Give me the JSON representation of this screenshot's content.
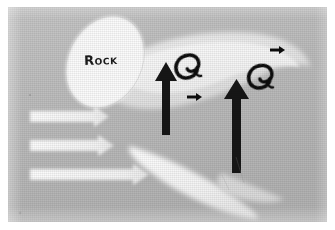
{
  "figure": {
    "kind": "photographed-diagram",
    "frame": {
      "width": 335,
      "height": 230,
      "plate_left": 8,
      "plate_top": 7,
      "plate_width": 319,
      "plate_height": 215,
      "background_color": "#b9b9b9",
      "paper_color": "#ffffff"
    }
  },
  "labels": {
    "rock": "Rock"
  },
  "colors": {
    "background_gray": "#b9b9b9",
    "wake_light": "#e9e9e9",
    "wake_pale": "#f4f4f4",
    "rock_white": "#fbfbfb",
    "arrow_white": "#fdfdfd",
    "arrow_black": "#121212",
    "eddy_black": "#101010",
    "label_text": "#1a1a1a"
  },
  "elements": {
    "rock": {
      "name": "rock",
      "shape": "tilted-ellipse",
      "cx": 105,
      "cy": 60,
      "rx": 40,
      "ry": 52,
      "rotation_deg": 28
    },
    "wake_upper": {
      "name": "upper-wake-lens",
      "shape": "lens",
      "note": "large pale lens-shaped separation zone downstream of the rock"
    },
    "wake_inner": {
      "name": "inner-wake-lens",
      "shape": "lens",
      "note": "brighter inner recirculation core inside the upper wake"
    },
    "wake_lower": {
      "name": "lower-wake-blade",
      "shape": "blade",
      "note": "lower white blade-shaped shear layer extending down-right"
    },
    "flow_arrows_white": [
      {
        "name": "approach-flow-arrow-1",
        "direction": "right",
        "x": 27,
        "y": 113,
        "length": 88,
        "thickness": 11
      },
      {
        "name": "approach-flow-arrow-2",
        "direction": "right",
        "x": 27,
        "y": 141,
        "length": 90,
        "thickness": 11
      },
      {
        "name": "approach-flow-arrow-3",
        "direction": "right",
        "x": 27,
        "y": 170,
        "length": 110,
        "thickness": 11
      }
    ],
    "return_arrows_black": [
      {
        "name": "return-flow-arrow-left",
        "direction": "up",
        "x": 166,
        "y_tail": 130,
        "y_head": 72,
        "thickness": 8
      },
      {
        "name": "return-flow-arrow-right",
        "direction": "up",
        "x": 236,
        "y_tail": 168,
        "y_head": 92,
        "thickness": 9
      }
    ],
    "small_arrows_black": [
      {
        "name": "small-flow-arrow-middle",
        "direction": "right",
        "x": 189,
        "y": 94,
        "length": 13
      },
      {
        "name": "small-flow-arrow-upper-right",
        "direction": "right",
        "x": 272,
        "y": 47,
        "length": 13
      }
    ],
    "eddies": [
      {
        "name": "eddy-symbol-left",
        "cx": 186,
        "cy": 62,
        "radius": 11,
        "rotation_deg": -20
      },
      {
        "name": "eddy-symbol-right",
        "cx": 258,
        "cy": 72,
        "radius": 11,
        "rotation_deg": -15
      }
    ]
  }
}
